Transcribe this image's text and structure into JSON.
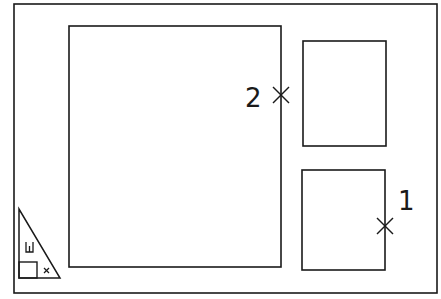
{
  "drawing": {
    "colors": {
      "background": "#ffffff",
      "stroke": "#1a1a1a"
    },
    "frame": {
      "x": 14,
      "y": 4,
      "w": 423,
      "h": 289
    },
    "rectangles": [
      {
        "name": "main-viewport-rect",
        "x": 69,
        "y": 26,
        "w": 212,
        "h": 241
      },
      {
        "name": "top-right-viewport-rect",
        "x": 303,
        "y": 41,
        "w": 83,
        "h": 105
      },
      {
        "name": "bottom-right-viewport-rect",
        "x": 302,
        "y": 170,
        "w": 83,
        "h": 100
      }
    ],
    "markers": [
      {
        "id": "marker-2",
        "label": "2",
        "x": 281,
        "y": 95,
        "label_x": 246,
        "label_y": 106
      },
      {
        "id": "marker-1",
        "label": "1",
        "x": 385,
        "y": 226,
        "label_x": 399,
        "label_y": 209
      }
    ],
    "ucs_icon": {
      "label": "W",
      "axis_mark": "×"
    }
  }
}
